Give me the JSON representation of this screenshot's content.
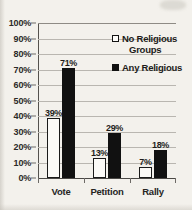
{
  "chart_data": {
    "type": "bar",
    "title": "",
    "subtitle": "",
    "xlabel": "",
    "ylabel": "",
    "categories": [
      "Vote",
      "Petition",
      "Rally"
    ],
    "series": [
      {
        "name": "No Religious Groups",
        "marker": "hollow-square",
        "color": "#ffffff",
        "edge_color": "#111111",
        "values": [
          39,
          13,
          7
        ],
        "labels": [
          "39%",
          "13%",
          "7%"
        ]
      },
      {
        "name": "Any Religious",
        "marker": "filled-square",
        "color": "#111111",
        "edge_color": "#111111",
        "values": [
          71,
          29,
          18
        ],
        "labels": [
          "71%",
          "29%",
          "18%"
        ]
      }
    ],
    "ylim": [
      0,
      100
    ],
    "y_ticks": [
      0,
      10,
      20,
      30,
      40,
      50,
      60,
      70,
      80,
      90,
      100
    ],
    "y_tick_labels": [
      "0%",
      "10%",
      "20%",
      "30%",
      "40%",
      "50%",
      "60%",
      "70%",
      "80%",
      "90%",
      "100%"
    ],
    "grid": "horizontal",
    "legend_position": "upper-right-inside",
    "value_labels": true,
    "units": "percent"
  },
  "legend": {
    "entries": [
      {
        "label_line1": "No Religious",
        "label_line2": "Groups",
        "swatch": "hollow-square"
      },
      {
        "label_line1": "Any Religious",
        "label_line2": "",
        "swatch": "filled-square"
      }
    ]
  },
  "colors": {
    "background": "#f3f1ec",
    "grid": "#b9b6b0",
    "axis": "#55524e",
    "text": "#1f1e1c",
    "series_a_fill": "#fbfaf7",
    "series_b_fill": "#111111"
  }
}
